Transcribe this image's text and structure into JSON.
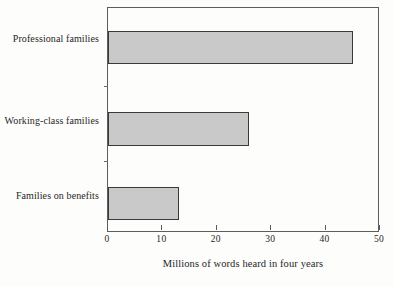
{
  "chart_data": {
    "type": "bar",
    "orientation": "horizontal",
    "title": "",
    "subtitle": "",
    "categories": [
      "Professional families",
      "Working-class families",
      "Families on benefits"
    ],
    "values": [
      45,
      26,
      13
    ],
    "series": [
      {
        "name": "Millions of words heard in four years",
        "values": [
          45,
          26,
          13
        ]
      }
    ],
    "xlabel": "Millions of words heard in four years",
    "ylabel": "",
    "xlim": [
      0,
      50
    ],
    "xticks": [
      0,
      10,
      20,
      30,
      40,
      50
    ],
    "xtick_labels": [
      "0",
      "10",
      "20",
      "30",
      "40",
      "50"
    ],
    "grid": false,
    "legend": false,
    "legend_position": "none",
    "bar_fill_color": "#c9c9c9",
    "bar_edge_color": "#3a3a3a",
    "axis_color": "#5d5d5d",
    "background_color": "#fdfdfc",
    "text_color": "#262626"
  },
  "axis": {
    "x_title": "Millions of words heard in four years"
  }
}
